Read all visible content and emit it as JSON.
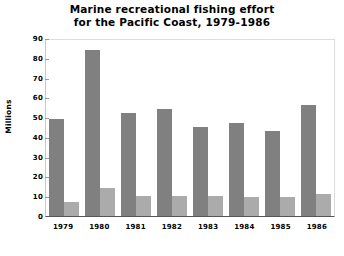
{
  "chart_data": {
    "type": "bar",
    "title": "Marine recreational fishing effort for the Pacific Coast, 1979-1986",
    "title_lines": [
      "Marine recreational fishing effort",
      "for the Pacific Coast, 1979-1986"
    ],
    "xlabel": "",
    "ylabel": "Millions",
    "ylim": [
      0,
      90
    ],
    "yticks": [
      0,
      10,
      20,
      30,
      40,
      50,
      60,
      70,
      80,
      90
    ],
    "ytick_labels": [
      "0",
      "10",
      "20",
      "30",
      "40",
      "50",
      "60",
      "70",
      "80",
      "90"
    ],
    "categories": [
      "1979",
      "1980",
      "1981",
      "1982",
      "1983",
      "1984",
      "1985",
      "1986"
    ],
    "grid": false,
    "legend": "none",
    "series": [
      {
        "name": "series-dark",
        "color": "#808080",
        "values": [
          49,
          84,
          52,
          54,
          45,
          47,
          43,
          56
        ]
      },
      {
        "name": "series-light",
        "color": "#ababab",
        "values": [
          7,
          14,
          10,
          10,
          10,
          9.5,
          9.5,
          11
        ]
      }
    ]
  },
  "colors": {
    "background": "#ffffff",
    "text": "#000000",
    "axis": "#555555",
    "bar_dark": "#808080",
    "bar_light": "#ababab"
  }
}
